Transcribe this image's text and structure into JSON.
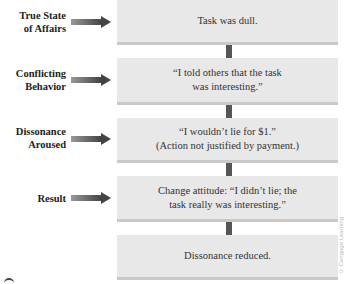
{
  "diagram": {
    "rows": [
      {
        "label": "True State of Affairs",
        "label_lines": [
          "True State",
          "of Affairs"
        ],
        "box_lines": [
          "Task was dull."
        ]
      },
      {
        "label": "Conflicting Behavior",
        "label_lines": [
          "Conflicting",
          "Behavior"
        ],
        "box_lines": [
          "“I told others that the task",
          "was interesting.”"
        ]
      },
      {
        "label": "Dissonance Aroused",
        "label_lines": [
          "Dissonance",
          "Aroused"
        ],
        "box_lines": [
          "“I wouldn’t lie for $1.”",
          "(Action not justified by payment.)"
        ]
      },
      {
        "label": "Result",
        "label_lines": [
          "Result"
        ],
        "box_lines": [
          "Change attitude: “I didn’t lie; the",
          "task really was interesting.”"
        ]
      },
      {
        "label": "",
        "label_lines": [],
        "box_lines": [
          "Dissonance reduced."
        ]
      }
    ],
    "watermark": "© Cengage Learning",
    "colors": {
      "box": "#e8e8e8",
      "box_shadow": "#c9c9c9",
      "connector": "#555555",
      "arrow": "#555555"
    }
  }
}
